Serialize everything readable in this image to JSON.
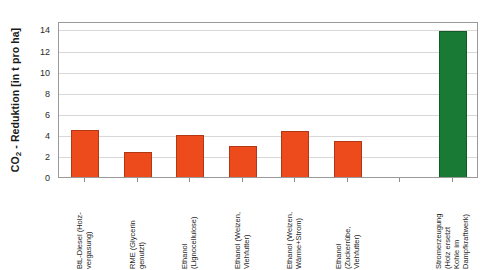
{
  "chart_data": {
    "type": "bar",
    "title": "",
    "xlabel": "",
    "ylabel": "CO2 - Reduktion [in t pro ha]",
    "ylabel_parts": {
      "pre": "CO",
      "sub": "2",
      "post": " - Reduktion [in t pro ha]"
    },
    "ylim": [
      0,
      14.8
    ],
    "yticks": [
      0,
      2,
      4,
      6,
      8,
      10,
      12,
      14
    ],
    "ytick_labels": [
      "0",
      "2",
      "4",
      "6",
      "8",
      "10",
      "12",
      "14"
    ],
    "grid": true,
    "legend": "none",
    "slots": 8,
    "categories": [
      "BtL-Diesel (Holz-vergasung)",
      "RME (Glycerin genutzt)",
      "Ethanol (Lignocellulose)",
      "Ethanol (Weizen, Viehfutter)",
      "Ethanol (Weizen, Wärme+Strom)",
      "Ethanol (Zuckerrübe, Viehfutter)",
      "Stromerzeugung (Holz ersetzt Kohle im Dampfkraftwerk)"
    ],
    "category_lines": [
      [
        "BtL-Diesel (Holz-",
        "vergasung)"
      ],
      [
        "RME (Glycerin",
        "genutzt)"
      ],
      [
        "Ethanol",
        "(Lignocellulose)"
      ],
      [
        "Ethanol (Weizen,",
        "Viehfutter)"
      ],
      [
        "Ethanol (Weizen,",
        "Wärme+Strom)"
      ],
      [
        "Ethanol",
        "(Zuckerrübe,",
        "Viehfutter)"
      ],
      [
        "Stromerzeugung",
        "(Holz ersetzt",
        "Kohle im",
        "Dampfkraftwerk)"
      ]
    ],
    "values": [
      4.5,
      2.4,
      4.0,
      2.9,
      4.4,
      3.4,
      13.9
    ],
    "slot_index": [
      0,
      1,
      2,
      3,
      4,
      5,
      7
    ],
    "bar_colors": [
      "#ee4b1c",
      "#ee4b1c",
      "#ee4b1c",
      "#ee4b1c",
      "#ee4b1c",
      "#ee4b1c",
      "#187a35"
    ],
    "colors": {
      "series_orange": "#ee4b1c",
      "series_green": "#187a35",
      "grid": "#d8d8d8",
      "frame": "#9a9a9a",
      "text": "#1f1f1f",
      "background": "#ffffff"
    }
  }
}
